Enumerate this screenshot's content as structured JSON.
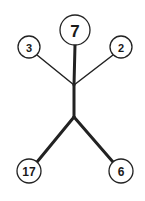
{
  "diagram": {
    "type": "stick-figure-number-tree",
    "nodes": {
      "head": {
        "label": "7",
        "cx": 75,
        "cy": 30,
        "r": 15,
        "font_size": 17
      },
      "left_hand": {
        "label": "3",
        "cx": 29,
        "cy": 47,
        "r": 11,
        "font_size": 11
      },
      "right_hand": {
        "label": "2",
        "cx": 121,
        "cy": 47,
        "r": 11,
        "font_size": 11
      },
      "left_foot": {
        "label": "17",
        "cx": 29,
        "cy": 171,
        "r": 12,
        "font_size": 12
      },
      "right_foot": {
        "label": "6",
        "cx": 121,
        "cy": 171,
        "r": 12,
        "font_size": 12
      }
    },
    "junctions": {
      "shoulders": {
        "x": 74,
        "y": 85
      },
      "hips": {
        "x": 74,
        "y": 117
      }
    },
    "colors": {
      "line": "#222222",
      "circle_fill": "#ffffff",
      "text": "#1a1a1a"
    }
  }
}
